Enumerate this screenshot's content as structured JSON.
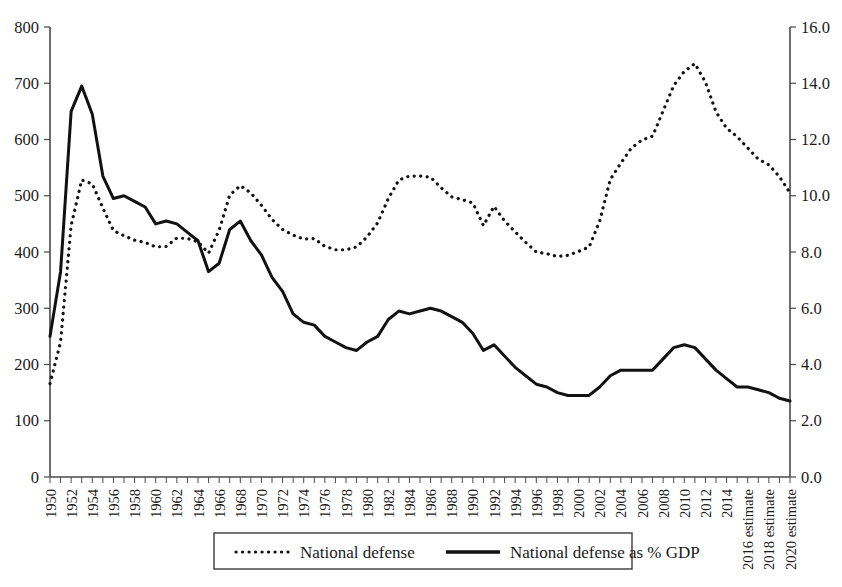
{
  "chart_data": {
    "type": "line",
    "title": "",
    "subtitle": "",
    "xlabel": "",
    "ylabel": "",
    "grid": false,
    "legend_position": "bottom-center",
    "x": [
      "1950",
      "1951",
      "1952",
      "1953",
      "1954",
      "1955",
      "1956",
      "1957",
      "1958",
      "1959",
      "1960",
      "1961",
      "1962",
      "1963",
      "1964",
      "1965",
      "1966",
      "1967",
      "1968",
      "1969",
      "1970",
      "1971",
      "1972",
      "1973",
      "1974",
      "1975",
      "1976",
      "1977",
      "1978",
      "1979",
      "1980",
      "1981",
      "1982",
      "1983",
      "1984",
      "1985",
      "1986",
      "1987",
      "1988",
      "1989",
      "1990",
      "1991",
      "1992",
      "1993",
      "1994",
      "1995",
      "1996",
      "1997",
      "1998",
      "1999",
      "2000",
      "2001",
      "2002",
      "2003",
      "2004",
      "2005",
      "2006",
      "2007",
      "2008",
      "2009",
      "2010",
      "2011",
      "2012",
      "2013",
      "2014",
      "2015",
      "2016 estimate",
      "2017",
      "2018 estimate",
      "2019",
      "2020 estimate"
    ],
    "x_tick_labels": [
      "1950",
      "1952",
      "1954",
      "1956",
      "1958",
      "1960",
      "1962",
      "1964",
      "1966",
      "1968",
      "1970",
      "1972",
      "1974",
      "1976",
      "1978",
      "1980",
      "1982",
      "1984",
      "1986",
      "1988",
      "1990",
      "1992",
      "1994",
      "1996",
      "1998",
      "2000",
      "2002",
      "2004",
      "2006",
      "2008",
      "2010",
      "2012",
      "2014",
      "2016 estimate",
      "2018 estimate",
      "2020 estimate"
    ],
    "axes": {
      "left": {
        "label": "",
        "ylim": [
          0,
          800
        ],
        "ticks": [
          0,
          100,
          200,
          300,
          400,
          500,
          600,
          700,
          800
        ],
        "tick_labels": [
          "0",
          "100",
          "200",
          "300",
          "400",
          "500",
          "600",
          "700",
          "800"
        ],
        "series": "National defense"
      },
      "right": {
        "label": "",
        "ylim": [
          0.0,
          16.0
        ],
        "ticks": [
          0.0,
          2.0,
          4.0,
          6.0,
          8.0,
          10.0,
          12.0,
          14.0,
          16.0
        ],
        "tick_labels": [
          "0.0",
          "2.0",
          "4.0",
          "6.0",
          "8.0",
          "10.0",
          "12.0",
          "14.0",
          "16.0"
        ],
        "series": "National defense as % GDP"
      }
    },
    "series": [
      {
        "name": "National defense",
        "style": "dotted",
        "axis": "left",
        "units": "billions of dollars",
        "values": [
          166,
          240,
          447,
          528,
          521,
          478,
          438,
          429,
          421,
          417,
          409,
          410,
          425,
          424,
          418,
          398,
          439,
          501,
          518,
          505,
          483,
          458,
          440,
          430,
          423,
          424,
          410,
          404,
          404,
          409,
          427,
          452,
          495,
          528,
          535,
          535,
          533,
          514,
          498,
          493,
          487,
          447,
          481,
          455,
          436,
          417,
          400,
          397,
          392,
          394,
          401,
          409,
          455,
          529,
          558,
          585,
          599,
          606,
          651,
          696,
          721,
          735,
          702,
          649,
          620,
          605,
          585,
          565,
          555,
          534,
          505
        ]
      },
      {
        "name": "National defense as % GDP",
        "style": "solid",
        "axis": "right",
        "units": "percent of GDP",
        "values": [
          5.0,
          7.3,
          13.0,
          13.9,
          12.9,
          10.7,
          9.9,
          10.0,
          9.8,
          9.6,
          9.0,
          9.1,
          9.0,
          8.7,
          8.4,
          7.3,
          7.6,
          8.8,
          9.1,
          8.4,
          7.9,
          7.1,
          6.6,
          5.8,
          5.5,
          5.4,
          5.0,
          4.8,
          4.6,
          4.5,
          4.8,
          5.0,
          5.6,
          5.9,
          5.8,
          5.9,
          6.0,
          5.9,
          5.7,
          5.5,
          5.1,
          4.5,
          4.7,
          4.3,
          3.9,
          3.6,
          3.3,
          3.2,
          3.0,
          2.9,
          2.9,
          2.9,
          3.2,
          3.6,
          3.8,
          3.8,
          3.8,
          3.8,
          4.2,
          4.6,
          4.7,
          4.6,
          4.2,
          3.8,
          3.5,
          3.2,
          3.2,
          3.1,
          3.0,
          2.8,
          2.7
        ]
      }
    ],
    "legend": [
      {
        "label": "National defense",
        "style": "dotted"
      },
      {
        "label": "National defense as % GDP",
        "style": "solid"
      }
    ]
  }
}
